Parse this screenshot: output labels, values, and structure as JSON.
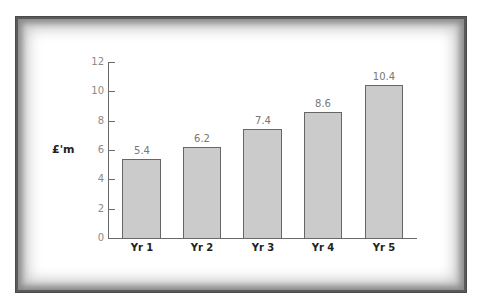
{
  "chart_data": {
    "type": "bar",
    "title": "",
    "xlabel": "",
    "ylabel": "£'m",
    "categories": [
      "Yr 1",
      "Yr 2",
      "Yr 3",
      "Yr 4",
      "Yr 5"
    ],
    "values": [
      5.4,
      6.2,
      7.4,
      8.6,
      10.4
    ],
    "value_labels": [
      "5.4",
      "6.2",
      "7.4",
      "8.6",
      "10.4"
    ],
    "ylim": [
      0,
      12
    ],
    "yticks": [
      "0",
      "2",
      "4",
      "6",
      "8",
      "10",
      "12"
    ],
    "grid": false,
    "legend": null,
    "bar_color": "#cbcbcb",
    "bar_edge_color": "#666666"
  }
}
